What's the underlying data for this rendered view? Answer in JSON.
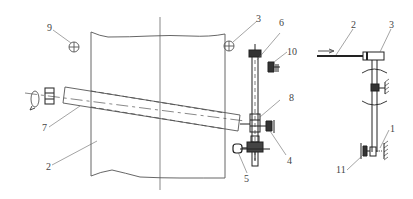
{
  "diagram": {
    "type": "mechanical schematic",
    "colors": {
      "line": "#555555",
      "heavy": "#222222",
      "label": "#444444",
      "background": "#ffffff"
    },
    "labels": {
      "l1": "1",
      "l2_main": "2",
      "l2_side": "2",
      "l3_main": "3",
      "l3_side": "3",
      "l4": "4",
      "l5": "5",
      "l6": "6",
      "l7": "7",
      "l8": "8",
      "l9": "9",
      "l10": "10",
      "l11": "11"
    },
    "components": [
      {
        "id": "1",
        "view": "side",
        "description": "spring stop at lower end of rod"
      },
      {
        "id": "2",
        "view": "main/side",
        "description": "web / sheet panel (main), push rod (side)"
      },
      {
        "id": "3",
        "view": "main/side",
        "description": "sensor marker (main), sleeve (side)"
      },
      {
        "id": "4",
        "view": "main",
        "description": "drive gearbox"
      },
      {
        "id": "5",
        "view": "main",
        "description": "motor"
      },
      {
        "id": "6",
        "view": "main",
        "description": "vertical screw shaft"
      },
      {
        "id": "7",
        "view": "main",
        "description": "inclined roller"
      },
      {
        "id": "8",
        "view": "main",
        "description": "slider nut"
      },
      {
        "id": "9",
        "view": "main",
        "description": "sensor marker"
      },
      {
        "id": "10",
        "view": "main",
        "description": "limit bracket"
      },
      {
        "id": "11",
        "view": "side",
        "description": "pivot bracket"
      }
    ]
  }
}
